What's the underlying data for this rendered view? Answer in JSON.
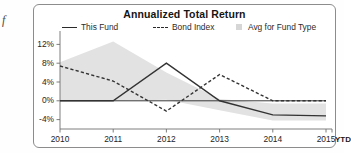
{
  "margin_glyph": "f",
  "chart_data": {
    "type": "line",
    "title": "Annualized Total Return",
    "xlabel": "",
    "ylabel": "",
    "grid": false,
    "legend_position": "top",
    "x": [
      "2010",
      "2011",
      "2012",
      "2013",
      "2014",
      "2015"
    ],
    "xtick_labels": [
      "2010",
      "2011",
      "2012",
      "2013",
      "2014",
      "2015"
    ],
    "extra_xtick": "YTD",
    "ytick_labels": [
      "12%",
      "8%",
      "4%",
      "0%",
      "-4%"
    ],
    "ytick_values": [
      12,
      8,
      4,
      0,
      -4
    ],
    "ylim": [
      -6,
      14
    ],
    "zero_line": 0,
    "series": [
      {
        "name": "This Fund",
        "style": "solid",
        "color": "#333333",
        "values": [
          0,
          0,
          8,
          0,
          -3,
          -3.2
        ]
      },
      {
        "name": "Bond Index",
        "style": "dashed",
        "color": "#333333",
        "values": [
          7.4,
          4.2,
          -2.2,
          5.6,
          0,
          0
        ]
      },
      {
        "name": "Avg for Fund Type",
        "style": "band",
        "color": "#e2e2e2",
        "upper": [
          8.2,
          12.6,
          6.0,
          0.4,
          -0.6,
          -0.6
        ],
        "lower": [
          0,
          0,
          0.2,
          -2.0,
          -4.2,
          -4.2
        ]
      }
    ],
    "legend": [
      {
        "label": "This Fund",
        "marker": "solid-line"
      },
      {
        "label": "Bond Index",
        "marker": "dashed-line"
      },
      {
        "label": "Avg for Fund Type",
        "marker": "gray-square"
      }
    ]
  },
  "colors": {
    "band": "#e2e2e2",
    "line": "#333333",
    "axis": "#6f6f6f",
    "border": "#8c8c8c"
  }
}
